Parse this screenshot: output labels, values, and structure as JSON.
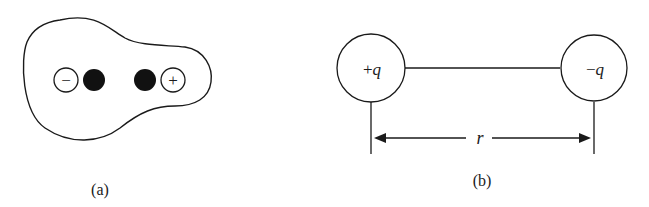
{
  "panel_a": {
    "caption": "(a)",
    "charges": [
      {
        "type": "open",
        "sign": "−"
      },
      {
        "type": "filled"
      },
      {
        "type": "filled"
      },
      {
        "type": "open",
        "sign": "+"
      }
    ]
  },
  "panel_b": {
    "caption": "(b)",
    "left_charge": {
      "sign": "+",
      "symbol": "q"
    },
    "right_charge": {
      "sign": "−",
      "symbol": "q"
    },
    "distance_label": "r"
  },
  "colors": {
    "ink": "#1a1a1a",
    "background": "#ffffff"
  }
}
